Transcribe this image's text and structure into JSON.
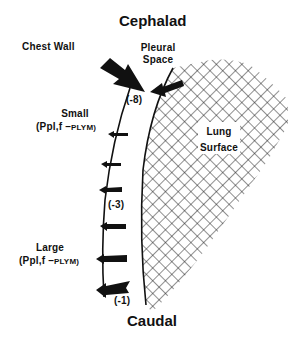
{
  "diagram": {
    "top_label": "Cephalad",
    "bottom_label": "Caudal",
    "chest_wall_label": "Chest Wall",
    "pleural_space_label": [
      "Pleural",
      "Space"
    ],
    "lung_surface_label": [
      "Lung",
      "Surface"
    ],
    "small_gradient": {
      "label": "Small",
      "formula_prefix": "(Ppl,f",
      "formula_minus": " –",
      "formula_suffix": "PLYM)"
    },
    "large_gradient": {
      "label": "Large",
      "formula_prefix": "(Ppl,f",
      "formula_minus": " –",
      "formula_suffix": "PLYM)"
    },
    "pressure_values": {
      "top": "(-8)",
      "middle": "(-3)",
      "bottom": "(-1)"
    },
    "colors": {
      "ink": "#111111",
      "background": "#ffffff"
    }
  }
}
